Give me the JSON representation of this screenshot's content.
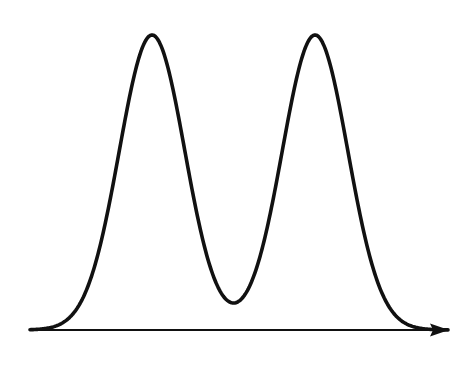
{
  "chart_data": {
    "type": "line",
    "title": "",
    "xlabel": "",
    "ylabel": "",
    "grid": false,
    "legend": null,
    "x_axis": {
      "arrow": true,
      "ticks": []
    },
    "y_axis": {
      "visible": false
    },
    "xlim": [
      0,
      100
    ],
    "ylim": [
      0,
      1
    ],
    "series": [
      {
        "name": "density",
        "components": [
          {
            "mean": 29.2,
            "sigma": 7.85,
            "amplitude": 1.0
          },
          {
            "mean": 68.2,
            "sigma": 7.85,
            "amplitude": 1.0
          }
        ],
        "key_points": [
          {
            "label": "left tail",
            "x": 0,
            "y": 0.0
          },
          {
            "label": "peak 1",
            "x": 29.2,
            "y": 1.0
          },
          {
            "label": "valley",
            "x": 48.7,
            "y": 0.092
          },
          {
            "label": "peak 2",
            "x": 68.2,
            "y": 1.0
          },
          {
            "label": "right tail",
            "x": 100,
            "y": 0.0
          }
        ]
      }
    ],
    "colors": {
      "curve": "#111111",
      "axis": "#111111",
      "background": "#ffffff"
    }
  }
}
